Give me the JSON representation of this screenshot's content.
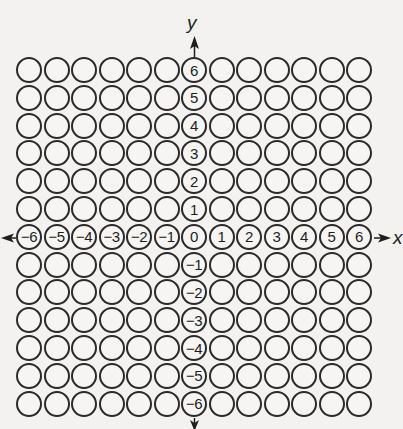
{
  "diagram": {
    "type": "coordinate-grid-of-circles",
    "rows": 13,
    "cols": 13,
    "x_axis": {
      "label": "x",
      "ticks": [
        "-6",
        "-5",
        "-4",
        "-3",
        "-2",
        "-1",
        "0",
        "1",
        "2",
        "3",
        "4",
        "5",
        "6"
      ]
    },
    "y_axis": {
      "label": "y",
      "ticks": [
        "6",
        "5",
        "4",
        "3",
        "2",
        "1",
        "0",
        "-1",
        "-2",
        "-3",
        "-4",
        "-5",
        "-6"
      ]
    },
    "colors": {
      "stroke": "#2a2a2a",
      "background": "#f3f2f0",
      "text": "#1e1e1e"
    },
    "geometry": {
      "origin_x": 16,
      "origin_y": 57,
      "cell_w": 27.5,
      "cell_h": 27.8
    }
  }
}
